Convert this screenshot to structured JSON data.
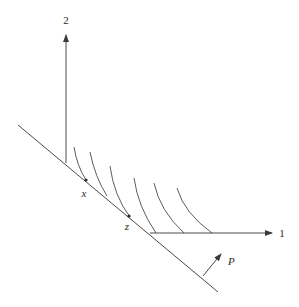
{
  "diagram": {
    "axes": {
      "vertical_label": "2",
      "horizontal_label": "1"
    },
    "points": [
      {
        "label": "x"
      },
      {
        "label": "z"
      }
    ],
    "price_vector_label": "P",
    "curve_count": 6,
    "colors": {
      "line": "#4a4a4a",
      "background": "#ffffff"
    }
  }
}
